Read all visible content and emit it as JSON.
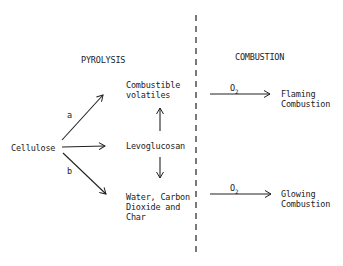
{
  "headings": {
    "pyrolysis": "PYROLYSIS",
    "combustion": "COMBUSTION"
  },
  "nodes": {
    "cellulose": "Cellulose",
    "volatiles_line1": "Combustible",
    "volatiles_line2": "volatiles",
    "levoglucosan": "Levoglucosan",
    "char_line1": "Water, Carbon",
    "char_line2": "Dioxide and",
    "char_line3": "Char",
    "flaming_line1": "Flaming",
    "flaming_line2": "Combustion",
    "glowing_line1": "Glowing",
    "glowing_line2": "Combustion"
  },
  "edge_labels": {
    "a": "a",
    "b": "b",
    "o2_top": "O",
    "o2_top_sub": "2",
    "o2_bottom": "O",
    "o2_bottom_sub": "2"
  },
  "colors": {
    "ink": "#222222",
    "background": "#ffffff"
  }
}
